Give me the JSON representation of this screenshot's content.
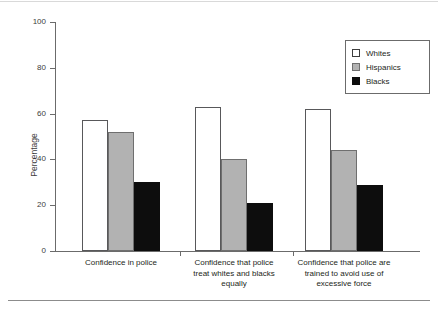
{
  "chart_data": {
    "type": "bar",
    "title": "",
    "xlabel": "",
    "ylabel": "Percentage",
    "ylim": [
      0,
      100
    ],
    "yticks": [
      0,
      20,
      40,
      60,
      80,
      100
    ],
    "grid": false,
    "legend_position": "top-right",
    "categories": [
      "Confidence in police",
      "Confidence that police treat whites and blacks equally",
      "Confidence that police are trained to avoid use of excessive force"
    ],
    "category_lines": [
      [
        "Confidence in police"
      ],
      [
        "Confidence that police",
        "treat whites and blacks",
        "equally"
      ],
      [
        "Confidence that police are",
        "trained to avoid use of",
        "excessive force"
      ]
    ],
    "series": [
      {
        "name": "Whites",
        "color": "#ffffff",
        "values": [
          57,
          63,
          62
        ]
      },
      {
        "name": "Hispanics",
        "color": "#b2b2b2",
        "values": [
          52,
          40,
          44
        ]
      },
      {
        "name": "Blacks",
        "color": "#0d0d0d",
        "values": [
          30,
          21,
          29
        ]
      }
    ]
  },
  "legend": {
    "entries": [
      "Whites",
      "Hispanics",
      "Blacks"
    ]
  },
  "axis": {
    "y_title": "Percentage",
    "y_tick_labels": [
      "0",
      "20",
      "40",
      "60",
      "80",
      "100"
    ]
  }
}
